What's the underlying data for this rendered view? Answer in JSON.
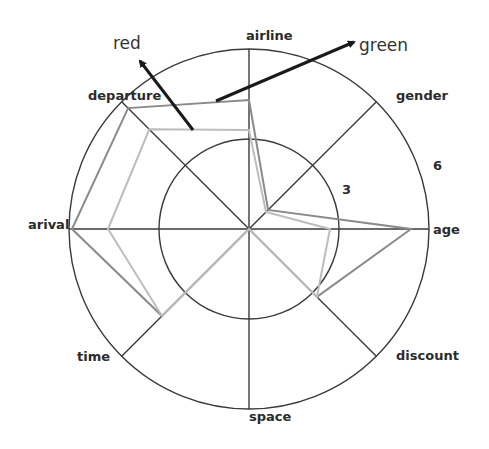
{
  "chart_data": {
    "type": "radar",
    "title": "",
    "axes": [
      "airline",
      "gender",
      "age",
      "discount",
      "space",
      "time",
      "arival",
      "departure"
    ],
    "rmax": 6,
    "ticks": [
      {
        "value": 3,
        "label": "3"
      },
      {
        "value": 6,
        "label": "6"
      }
    ],
    "grid": true,
    "series": [
      {
        "name": "red",
        "color": "#8a8a8a",
        "values": [
          4.3,
          0.9,
          5.4,
          3.2,
          0,
          4.1,
          5.9,
          5.7
        ]
      },
      {
        "name": "green",
        "color": "#bdbdbd",
        "values": [
          3.3,
          0.8,
          2.7,
          3.2,
          0,
          4.1,
          4.7,
          4.7
        ]
      }
    ],
    "annotations": [
      {
        "text": "red",
        "arrow_from": [
          193,
          130
        ],
        "arrow_to": [
          138,
          58
        ],
        "label_pos": [
          113,
          48
        ]
      },
      {
        "text": "green",
        "arrow_from": [
          216,
          101
        ],
        "arrow_to": [
          357,
          40
        ],
        "label_pos": [
          359,
          51
        ]
      }
    ],
    "legend": "none (series identified by arrow annotations)"
  },
  "labels": {
    "airline": "airline",
    "gender": "gender",
    "age": "age",
    "discount": "discount",
    "space": "space",
    "time": "time",
    "arival": "arival",
    "departure": "departure",
    "tick3": "3",
    "tick6": "6",
    "red": "red",
    "green": "green"
  }
}
